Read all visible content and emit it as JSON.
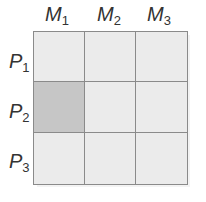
{
  "diagram": {
    "columns": [
      {
        "base": "M",
        "sub": "1"
      },
      {
        "base": "M",
        "sub": "2"
      },
      {
        "base": "M",
        "sub": "3"
      }
    ],
    "rows": [
      {
        "base": "P",
        "sub": "1"
      },
      {
        "base": "P",
        "sub": "2"
      },
      {
        "base": "P",
        "sub": "3"
      }
    ],
    "highlighted_cell": {
      "row": "P2",
      "column": "M1"
    },
    "colors": {
      "cell": "#ebebeb",
      "highlight": "#c6c6c6",
      "grid_line": "#8a8a8a"
    }
  }
}
